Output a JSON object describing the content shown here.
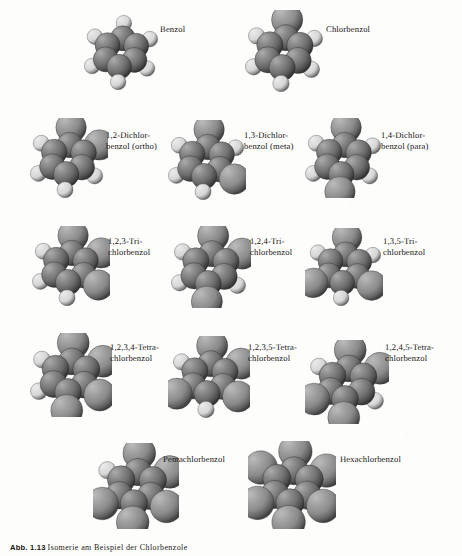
{
  "figure": {
    "caption_number": "Abb. 1.13",
    "caption_text": "Isomerie am Beispiel der Chlorbenzole",
    "background_color": "#fdfdfc",
    "text_color": "#161412",
    "model_type": "space-filling (Kalotten) molecular models",
    "carbon_color": "#6e6e6e",
    "chlorine_color": "#8a8a8a",
    "hydrogen_color": "#d6d6d6"
  },
  "rows": [
    {
      "row_index": 0,
      "molecules": [
        {
          "id": "benzol",
          "label": "Benzol",
          "chlorine_count": 0,
          "chlorine_positions": [],
          "hydrogen_count": 6,
          "x": 82,
          "y": 12,
          "size": 78,
          "label_x": 160,
          "label_y": 20
        },
        {
          "id": "chlorbenzol",
          "label": "Chlorbenzol",
          "chlorine_count": 1,
          "chlorine_positions": [
            1
          ],
          "hydrogen_count": 5,
          "x": 243,
          "y": 10,
          "size": 82,
          "label_x": 326,
          "label_y": 20
        }
      ]
    },
    {
      "row_index": 1,
      "molecules": [
        {
          "id": "1-2-dichlorbenzol-ortho",
          "label": "1,2-Dichlor-\nbenzol (ortho)",
          "chlorine_count": 2,
          "chlorine_positions": [
            1,
            2
          ],
          "hydrogen_count": 4,
          "x": 28,
          "y": 118,
          "size": 80,
          "label_x": 106,
          "label_y": 126
        },
        {
          "id": "1-3-dichlorbenzol-meta",
          "label": "1,3-Dichlor-\nbenzol (meta)",
          "chlorine_count": 2,
          "chlorine_positions": [
            1,
            3
          ],
          "hydrogen_count": 4,
          "x": 166,
          "y": 120,
          "size": 80,
          "label_x": 244,
          "label_y": 126
        },
        {
          "id": "1-4-dichlorbenzol-para",
          "label": "1,4-Dichlor-\nbenzol (para)",
          "chlorine_count": 2,
          "chlorine_positions": [
            1,
            4
          ],
          "hydrogen_count": 4,
          "x": 303,
          "y": 118,
          "size": 80,
          "label_x": 381,
          "label_y": 126
        }
      ]
    },
    {
      "row_index": 2,
      "molecules": [
        {
          "id": "1-2-3-trichlorbenzol",
          "label": "1,2,3-Tri-\nchlorbenzol",
          "chlorine_count": 3,
          "chlorine_positions": [
            1,
            2,
            3
          ],
          "hydrogen_count": 3,
          "x": 30,
          "y": 226,
          "size": 80,
          "label_x": 108,
          "label_y": 232
        },
        {
          "id": "1-2-4-trichlorbenzol",
          "label": "1,2,4-Tri-\nchlorbenzol",
          "chlorine_count": 3,
          "chlorine_positions": [
            1,
            2,
            4
          ],
          "hydrogen_count": 3,
          "x": 169,
          "y": 226,
          "size": 82,
          "label_x": 250,
          "label_y": 232
        },
        {
          "id": "1-3-5-trichlorbenzol",
          "label": "1,3,5-Tri-\nchlorbenzol",
          "chlorine_count": 3,
          "chlorine_positions": [
            1,
            3,
            5
          ],
          "hydrogen_count": 3,
          "x": 305,
          "y": 228,
          "size": 78,
          "label_x": 383,
          "label_y": 232
        }
      ]
    },
    {
      "row_index": 3,
      "molecules": [
        {
          "id": "1-2-3-4-tetrachlorbenzol",
          "label": "1,2,3,4-Tetra-\nchlorbenzol",
          "chlorine_count": 4,
          "chlorine_positions": [
            1,
            2,
            3,
            4
          ],
          "hydrogen_count": 2,
          "x": 28,
          "y": 333,
          "size": 84,
          "label_x": 110,
          "label_y": 338
        },
        {
          "id": "1-2-3-5-tetrachlorbenzol",
          "label": "1,2,3,5-Tetra-\nchlorbenzol",
          "chlorine_count": 4,
          "chlorine_positions": [
            1,
            2,
            3,
            5
          ],
          "hydrogen_count": 2,
          "x": 168,
          "y": 336,
          "size": 82,
          "label_x": 248,
          "label_y": 338
        },
        {
          "id": "1-2-4-5-tetrachlorbenzol",
          "label": "1,2,4,5-Tetra-\nchlorbenzol",
          "chlorine_count": 4,
          "chlorine_positions": [
            1,
            2,
            4,
            5
          ],
          "hydrogen_count": 2,
          "x": 305,
          "y": 340,
          "size": 84,
          "label_x": 385,
          "label_y": 338
        }
      ]
    },
    {
      "row_index": 4,
      "molecules": [
        {
          "id": "pentachlorbenzol",
          "label": "Pentachlorbenzol",
          "chlorine_count": 5,
          "chlorine_positions": [
            1,
            2,
            3,
            4,
            5
          ],
          "hydrogen_count": 1,
          "x": 93,
          "y": 443,
          "size": 86,
          "label_x": 163,
          "label_y": 450
        },
        {
          "id": "hexachlorbenzol",
          "label": "Hexachlorbenzol",
          "chlorine_count": 6,
          "chlorine_positions": [
            1,
            2,
            3,
            4,
            5,
            6
          ],
          "hydrogen_count": 0,
          "x": 248,
          "y": 441,
          "size": 88,
          "label_x": 340,
          "label_y": 450
        }
      ]
    }
  ]
}
